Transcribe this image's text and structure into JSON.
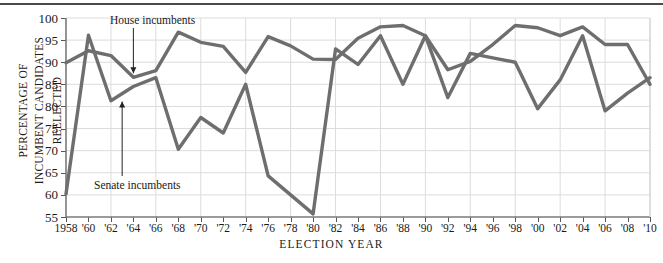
{
  "chart_data": {
    "type": "line",
    "title": "",
    "xlabel": "ELECTION YEAR",
    "ylabel": "PERCENTAGE OF INCUMBENT CANDIDATES REELECTED",
    "ylabel_line1": "PERCENTAGE OF",
    "ylabel_line2": "INCUMBENT CANDIDATES REELECTED",
    "ylim": [
      55,
      100
    ],
    "ytick_values": [
      55,
      60,
      65,
      70,
      75,
      80,
      85,
      90,
      95,
      100
    ],
    "ytick_labels": [
      "55",
      "60",
      "65",
      "70",
      "75",
      "80",
      "85",
      "90",
      "95",
      "100"
    ],
    "xlim": [
      1958,
      2010
    ],
    "x": [
      1958,
      1960,
      1962,
      1964,
      1966,
      1968,
      1970,
      1972,
      1974,
      1976,
      1978,
      1980,
      1982,
      1984,
      1986,
      1988,
      1990,
      1992,
      1994,
      1996,
      1998,
      2000,
      2002,
      2004,
      2006,
      2008,
      2010
    ],
    "xtick_labels": [
      "1958",
      "'60",
      "'62",
      "'64",
      "'66",
      "'68",
      "'70",
      "'72",
      "'74",
      "'76",
      "'78",
      "'80",
      "'82",
      "'84",
      "'86",
      "'88",
      "'90",
      "'92",
      "'94",
      "'96",
      "'98",
      "'00",
      "'02",
      "'04",
      "'06",
      "'08",
      "'10"
    ],
    "grid": true,
    "legend_position": "inline-annotations",
    "series": [
      {
        "name": "House incumbents",
        "color": "#6e6e6e",
        "values": [
          89.9,
          92.6,
          91.5,
          86.6,
          88.1,
          96.8,
          94.5,
          93.6,
          87.7,
          95.8,
          93.7,
          90.7,
          90.6,
          95.4,
          98.0,
          98.3,
          96.0,
          88.3,
          90.2,
          94.0,
          98.3,
          97.8,
          96.0,
          98.0,
          94.0,
          94.0,
          85.0
        ]
      },
      {
        "name": "Senate incumbents",
        "color": "#6e6e6e",
        "values": [
          60.2,
          96.1,
          81.3,
          84.5,
          86.5,
          70.3,
          77.5,
          74.0,
          85.0,
          64.3,
          60.0,
          55.7,
          93.0,
          89.5,
          96.0,
          85.0,
          96.0,
          82.0,
          92.0,
          91.0,
          90.0,
          79.5,
          86.0,
          96.0,
          79.0,
          83.0,
          86.5
        ]
      }
    ],
    "annotations": [
      {
        "text": "House incumbents",
        "target_year": 1964,
        "target_value": 86.6
      },
      {
        "text": "Senate incumbents",
        "target_year": 1963,
        "target_value": 82.0
      }
    ]
  }
}
